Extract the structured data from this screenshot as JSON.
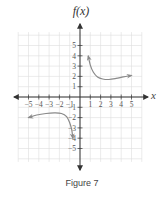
{
  "figure": {
    "caption": "Figure 7",
    "y_axis_label": "f(x)",
    "x_axis_label": "x"
  },
  "colors": {
    "grid": "#dddddd",
    "axis": "#333333",
    "curve": "#8a8a8a",
    "text": "#444444"
  },
  "chart_data": {
    "type": "line",
    "title": "",
    "caption": "Figure 7",
    "xlabel": "x",
    "ylabel": "f(x)",
    "xlim": [
      -6,
      6
    ],
    "ylim": [
      -6,
      6
    ],
    "grid": true,
    "legend": null,
    "x_ticks": [
      -5,
      -4,
      -3,
      -2,
      -1,
      1,
      2,
      3,
      4,
      5
    ],
    "y_ticks": [
      5,
      4,
      3,
      2,
      1,
      -1,
      -2,
      -3,
      -4,
      -5
    ],
    "x_tick_labels": [
      "−5",
      "−4",
      "−3",
      "−2",
      "−1",
      "1",
      "2",
      "3",
      "4",
      "5"
    ],
    "y_tick_labels": [
      "5",
      "4",
      "3",
      "2",
      "1",
      "−1",
      "−2",
      "−3",
      "−4",
      "−5"
    ],
    "series": [
      {
        "name": "right branch",
        "description": "Rises toward vertical asymptote x=0 at top-left (arrow), decreases to a minimum near x=2.5, then slowly increases with arrow to the right",
        "x": [
          0.8,
          1.0,
          1.3,
          1.7,
          2.2,
          2.8,
          3.5,
          4.2,
          5.0
        ],
        "y": [
          4.0,
          3.1,
          2.4,
          1.95,
          1.75,
          1.7,
          1.8,
          1.95,
          2.1
        ],
        "arrows": [
          "start",
          "end"
        ]
      },
      {
        "name": "left branch",
        "description": "Starts with arrow at left near (-5,-2), rises to a maximum near x=-2, then drops steeply toward vertical asymptote x=0 with arrow",
        "x": [
          -5.0,
          -4.2,
          -3.3,
          -2.5,
          -1.8,
          -1.3,
          -1.0,
          -0.8,
          -0.7
        ],
        "y": [
          -2.0,
          -1.75,
          -1.6,
          -1.55,
          -1.6,
          -1.9,
          -2.5,
          -3.2,
          -4.0
        ],
        "arrows": [
          "start",
          "end"
        ]
      }
    ]
  }
}
